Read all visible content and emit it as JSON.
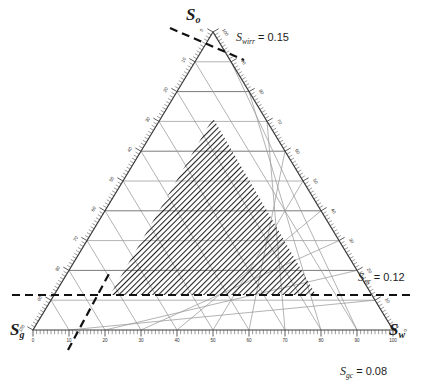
{
  "figure": {
    "type": "ternary-saturation-diagram",
    "vertices": {
      "top": {
        "symbol": "S",
        "sub": "o",
        "name": "oil-saturation"
      },
      "bottom_left": {
        "symbol": "S",
        "sub": "g",
        "name": "gas-saturation"
      },
      "bottom_right": {
        "symbol": "S",
        "sub": "w",
        "name": "water-saturation"
      }
    },
    "annotations": [
      {
        "id": "swirr",
        "symbol": "S",
        "sub": "wirr",
        "eq": " = 0.15",
        "text": "Swirr = 0.15",
        "x": 236,
        "y": 32
      },
      {
        "id": "sor",
        "symbol": "S",
        "sub": "or",
        "eq": " = 0.12",
        "text": "Sor = 0.12",
        "x": 360,
        "y": 277
      },
      {
        "id": "sgc",
        "symbol": "S",
        "sub": "gc",
        "eq": " = 0.08",
        "text": "Sgc = 0.08",
        "x": 342,
        "y": 366
      }
    ],
    "axis_ticks": [
      0,
      10,
      20,
      30,
      40,
      50,
      60,
      70,
      80,
      90,
      100
    ],
    "minor_ticks_per_major": 10,
    "grid_interval": 10,
    "grid_major_interval": 20,
    "shaded_region_label": "feasible three-phase flow region",
    "colors": {
      "line": "#6f6f6f",
      "axis": "#3c3c3c",
      "dashed": "#111111",
      "hatch": "#222222",
      "text": "#1c1c1c",
      "background": "#ffffff"
    }
  },
  "chart_data": {
    "type": "ternary",
    "title": "",
    "xlabel": "",
    "ylabel": "",
    "axes": [
      {
        "name": "So",
        "label": "S_o",
        "vertex": "top",
        "range": [
          0,
          100
        ],
        "ticks": [
          0,
          10,
          20,
          30,
          40,
          50,
          60,
          70,
          80,
          90,
          100
        ]
      },
      {
        "name": "Sg",
        "label": "S_g",
        "vertex": "bottom-left",
        "range": [
          0,
          100
        ],
        "ticks": [
          0,
          10,
          20,
          30,
          40,
          50,
          60,
          70,
          80,
          90,
          100
        ]
      },
      {
        "name": "Sw",
        "label": "S_w",
        "vertex": "bottom-right",
        "range": [
          0,
          100
        ],
        "ticks": [
          0,
          10,
          20,
          30,
          40,
          50,
          60,
          70,
          80,
          90,
          100
        ]
      }
    ],
    "constraints": [
      {
        "name": "Swirr",
        "value": 0.15,
        "display": "Swirr = 0.15",
        "style": "dashed",
        "meaning": "irreducible water saturation"
      },
      {
        "name": "Sor",
        "value": 0.12,
        "display": "Sor = 0.12",
        "style": "dashed",
        "meaning": "residual oil saturation"
      },
      {
        "name": "Sgc",
        "value": 0.08,
        "display": "Sgc = 0.08",
        "style": "dashed",
        "meaning": "critical gas saturation"
      }
    ],
    "shaded_region": {
      "fill": "diagonal-hatch",
      "vertices_ternary": [
        {
          "So": 0.77,
          "Sg": 0.08,
          "Sw": 0.15
        },
        {
          "So": 0.12,
          "Sg": 0.73,
          "Sw": 0.15
        },
        {
          "So": 0.12,
          "Sg": 0.08,
          "Sw": 0.8
        }
      ],
      "description": "three-phase mobile region bounded by Swirr, Sor and Sgc"
    },
    "grid": true,
    "legend": "none"
  }
}
